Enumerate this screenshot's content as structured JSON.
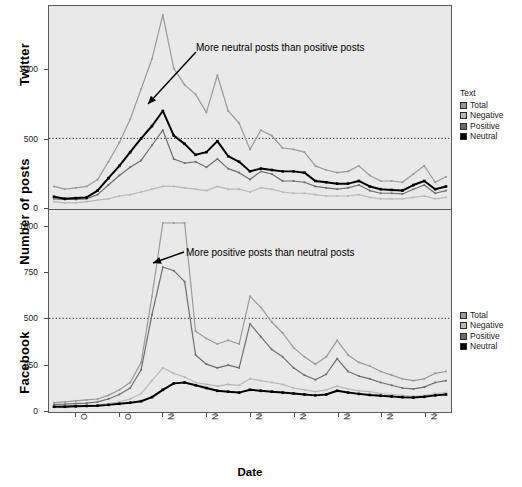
{
  "axes": {
    "y_title": "Number of posts",
    "x_title": "Date"
  },
  "panels": [
    {
      "strip_label": "Twitter",
      "yticks": [
        "1000",
        "500",
        "0"
      ]
    },
    {
      "strip_label": "Facebook",
      "yticks": [
        "1000",
        "750",
        "500",
        "250",
        "0"
      ]
    }
  ],
  "legend": {
    "title": "Text",
    "items": [
      {
        "label": "Total",
        "color": "#9a9a9a"
      },
      {
        "label": "Negative",
        "color": "#b9b9b9"
      },
      {
        "label": "Positive",
        "color": "#6e6e6e"
      },
      {
        "label": "Neutral",
        "color": "#000000"
      }
    ]
  },
  "annotations": [
    {
      "text": "More neutral posts than positive posts"
    },
    {
      "text": "More positive posts than neutral posts"
    }
  ],
  "chart_data": {
    "type": "line",
    "title": "",
    "xlabel": "Date",
    "ylabel": "Number of posts",
    "grid": false,
    "reference_line": {
      "value": 500,
      "style": "dotted"
    },
    "legend_position": "right",
    "legend_title": "Text",
    "x_tick_labels": [
      "Oct 27, 2012",
      "Oct 31, 2012",
      "Nov 04, 2012",
      "Nov 08, 2012",
      "Nov 12, 2012",
      "Nov 16, 2012",
      "Nov 20, 2012",
      "Nov 24, 2012",
      "Nov 28, 2012"
    ],
    "x_tick_dates": [
      "2012-10-27",
      "2012-10-31",
      "2012-11-04",
      "2012-11-08",
      "2012-11-12",
      "2012-11-16",
      "2012-11-20",
      "2012-11-24",
      "2012-11-28"
    ],
    "x": [
      "2012-10-25",
      "2012-10-26",
      "2012-10-27",
      "2012-10-28",
      "2012-10-29",
      "2012-10-30",
      "2012-10-31",
      "2012-11-01",
      "2012-11-02",
      "2012-11-03",
      "2012-11-04",
      "2012-11-05",
      "2012-11-06",
      "2012-11-07",
      "2012-11-08",
      "2012-11-09",
      "2012-11-10",
      "2012-11-11",
      "2012-11-12",
      "2012-11-13",
      "2012-11-14",
      "2012-11-15",
      "2012-11-16",
      "2012-11-17",
      "2012-11-18",
      "2012-11-19",
      "2012-11-20",
      "2012-11-21",
      "2012-11-22",
      "2012-11-23",
      "2012-11-24",
      "2012-11-25",
      "2012-11-26",
      "2012-11-27",
      "2012-11-28",
      "2012-11-29",
      "2012-11-30"
    ],
    "panels": [
      {
        "name": "Twitter",
        "ylim": [
          0,
          1450
        ],
        "yticks": [
          0,
          500,
          1000
        ],
        "series": [
          {
            "name": "Total",
            "color": "#9a9a9a",
            "values": [
              150,
              130,
              140,
              150,
              200,
              330,
              470,
              640,
              860,
              1080,
              1400,
              1010,
              890,
              820,
              690,
              960,
              700,
              610,
              420,
              560,
              520,
              430,
              420,
              400,
              300,
              270,
              250,
              260,
              300,
              230,
              190,
              190,
              180,
              240,
              300,
              180,
              220
            ]
          },
          {
            "name": "Negative",
            "color": "#b9b9b9",
            "values": [
              40,
              30,
              30,
              40,
              50,
              60,
              80,
              90,
              110,
              130,
              150,
              150,
              140,
              130,
              120,
              150,
              130,
              130,
              110,
              140,
              130,
              110,
              100,
              100,
              90,
              80,
              80,
              80,
              90,
              70,
              60,
              60,
              60,
              70,
              80,
              60,
              70
            ]
          },
          {
            "name": "Positive",
            "color": "#6e6e6e",
            "values": [
              60,
              55,
              55,
              60,
              90,
              160,
              230,
              290,
              340,
              450,
              560,
              350,
              320,
              330,
              290,
              350,
              280,
              250,
              200,
              260,
              240,
              190,
              190,
              180,
              150,
              140,
              130,
              140,
              160,
              120,
              100,
              100,
              95,
              130,
              160,
              100,
              120
            ]
          },
          {
            "name": "Neutral",
            "color": "#000000",
            "values": [
              75,
              60,
              65,
              70,
              120,
              210,
              300,
              400,
              500,
              590,
              700,
              520,
              460,
              380,
              400,
              480,
              370,
              330,
              260,
              280,
              270,
              260,
              260,
              250,
              190,
              180,
              170,
              170,
              190,
              150,
              130,
              125,
              120,
              160,
              190,
              130,
              150
            ]
          }
        ]
      },
      {
        "name": "Facebook",
        "ylim": [
          0,
          1080
        ],
        "yticks": [
          0,
          250,
          500,
          750,
          1000
        ],
        "series": [
          {
            "name": "Total",
            "color": "#9a9a9a",
            "values": [
              40,
              45,
              50,
              55,
              60,
              80,
              110,
              150,
              260,
              620,
              1020,
              1020,
              1020,
              430,
              390,
              360,
              380,
              360,
              620,
              560,
              480,
              420,
              340,
              290,
              250,
              290,
              380,
              300,
              260,
              240,
              210,
              190,
              170,
              160,
              170,
              200,
              210
            ]
          },
          {
            "name": "Negative",
            "color": "#b9b9b9",
            "values": [
              20,
              22,
              24,
              26,
              28,
              35,
              45,
              60,
              90,
              160,
              230,
              200,
              180,
              150,
              140,
              130,
              140,
              135,
              170,
              160,
              150,
              140,
              120,
              110,
              100,
              110,
              130,
              115,
              105,
              100,
              90,
              85,
              80,
              75,
              80,
              90,
              95
            ]
          },
          {
            "name": "Positive",
            "color": "#6e6e6e",
            "values": [
              30,
              32,
              35,
              38,
              45,
              60,
              85,
              120,
              220,
              520,
              780,
              760,
              700,
              300,
              250,
              230,
              245,
              230,
              470,
              400,
              330,
              290,
              230,
              190,
              165,
              195,
              280,
              210,
              185,
              170,
              150,
              135,
              120,
              115,
              125,
              150,
              160
            ]
          },
          {
            "name": "Neutral",
            "color": "#000000",
            "values": [
              18,
              18,
              20,
              22,
              24,
              28,
              34,
              40,
              48,
              70,
              110,
              145,
              150,
              135,
              120,
              105,
              100,
              95,
              110,
              105,
              100,
              95,
              90,
              85,
              80,
              85,
              105,
              95,
              88,
              82,
              78,
              74,
              70,
              68,
              72,
              80,
              85
            ]
          }
        ]
      }
    ]
  }
}
